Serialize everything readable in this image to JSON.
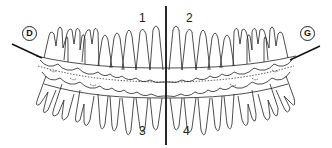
{
  "diagram": {
    "quadrants": [
      {
        "id": "q1",
        "label": "1",
        "position": "upper-left"
      },
      {
        "id": "q2",
        "label": "2",
        "position": "upper-right"
      },
      {
        "id": "q3",
        "label": "3",
        "position": "lower-left"
      },
      {
        "id": "q4",
        "label": "4",
        "position": "lower-right"
      }
    ],
    "sides": {
      "left": {
        "label": "D"
      },
      "right": {
        "label": "G"
      }
    },
    "colors": {
      "line": "#111111",
      "background": "#ffffff"
    },
    "teeth_per_quadrant": 8
  }
}
